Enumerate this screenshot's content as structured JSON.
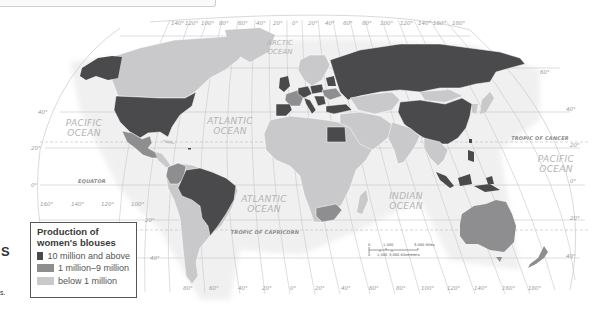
{
  "legend": {
    "title_line1": "Production of",
    "title_line2": "women's blouses",
    "items": [
      {
        "label": "10 million and above",
        "color": "#4a4a4c"
      },
      {
        "label": "1 million–9 million",
        "color": "#8e8e90"
      },
      {
        "label": "below 1 million",
        "color": "#c9c9cb"
      }
    ]
  },
  "colors": {
    "high": "#4a4a4c",
    "mid": "#8e8e90",
    "low": "#c9c9cb",
    "grid": "#c4c4c4",
    "ocean_bg": "#ffffff"
  },
  "oceans": {
    "arctic_line1": "ARCTIC",
    "arctic_line2": "OCEAN",
    "pacific_west_line1": "PACIFIC",
    "pacific_west_line2": "OCEAN",
    "atlantic_north_line1": "ATLANTIC",
    "atlantic_north_line2": "OCEAN",
    "atlantic_south_line1": "ATLANTIC",
    "atlantic_south_line2": "OCEAN",
    "indian_line1": "INDIAN",
    "indian_line2": "OCEAN",
    "pacific_east_line1": "PACIFIC",
    "pacific_east_line2": "OCEAN"
  },
  "reference_lines": {
    "equator": "EQUATOR",
    "tropic_cancer": "TROPIC OF CANCER",
    "tropic_capricorn": "TROPIC OF CAPRICORN"
  },
  "top_longitudes": [
    "140°",
    "120°",
    "100°",
    "80°",
    "60°",
    "40°",
    "20°",
    "0°",
    "20°",
    "40°",
    "60°",
    "80°",
    "100°",
    "120°",
    "140°",
    "160°",
    "180°"
  ],
  "bottom_longitudes": [
    "160°",
    "140°",
    "120°",
    "100°",
    "80°",
    "60°",
    "40°",
    "20°",
    "0°",
    "20°",
    "40°",
    "60°",
    "80°",
    "100°",
    "120°",
    "140°",
    "160°",
    "180°"
  ],
  "latitudes_left": [
    "40°",
    "20°",
    "0°",
    "20°",
    "40°"
  ],
  "latitudes_right": [
    "60°",
    "40°",
    "20°",
    "0°",
    "20°",
    "40°"
  ],
  "scale": {
    "miles_0": "0",
    "miles_mid": "1,500",
    "miles_max": "3,000 Miles",
    "km_0": "0",
    "km_mid": "1,500",
    "km_max": "3,000 Kilometers"
  },
  "page_fragments": {
    "left_char": "S",
    "left_end": "s."
  }
}
